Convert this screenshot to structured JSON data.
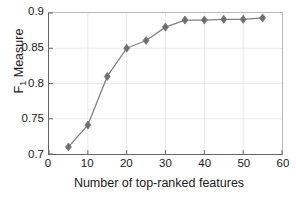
{
  "chart_data": {
    "type": "line",
    "title": "",
    "xlabel": "Number of top-ranked features",
    "ylabel": "F_1 Measure",
    "ylabel_base": "F",
    "ylabel_sub": "1",
    "ylabel_rest": " Measure",
    "x": [
      5,
      10,
      15,
      20,
      25,
      30,
      35,
      40,
      45,
      50,
      55
    ],
    "values": [
      0.71,
      0.741,
      0.81,
      0.85,
      0.861,
      0.88,
      0.89,
      0.89,
      0.891,
      0.891,
      0.893
    ],
    "series": [
      {
        "name": "F1 Measure",
        "values": [
          0.71,
          0.741,
          0.81,
          0.85,
          0.861,
          0.88,
          0.89,
          0.89,
          0.891,
          0.891,
          0.893
        ]
      }
    ],
    "xlim": [
      0,
      60
    ],
    "ylim": [
      0.7,
      0.9
    ],
    "xticks": [
      0,
      10,
      20,
      30,
      40,
      50,
      60
    ],
    "xtick_labels": [
      "0",
      "10",
      "20",
      "30",
      "40",
      "50",
      "60"
    ],
    "yticks": [
      0.7,
      0.75,
      0.8,
      0.85,
      0.9
    ],
    "ytick_labels": [
      "0.7",
      "0.75",
      "0.8",
      "0.85",
      "0.9"
    ],
    "grid": true,
    "legend": null,
    "legend_position": "none",
    "marker": "diamond",
    "line_color": "#808080",
    "marker_color": "#6e6e6e",
    "grid_color": "#e4e4e4",
    "axis_color": "#666666",
    "background_color": "#ffffff"
  }
}
